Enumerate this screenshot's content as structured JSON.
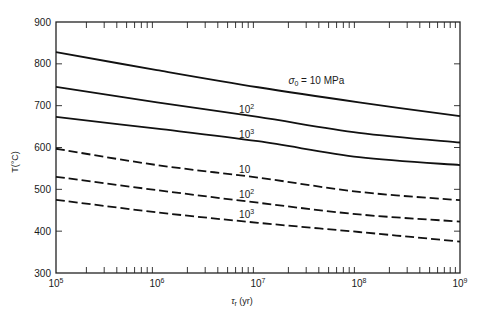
{
  "chart_data": {
    "type": "line",
    "title": "",
    "xlabel": "τr (yr)",
    "ylabel": "T(°C)",
    "xscale": "log",
    "xlim": [
      100000,
      1000000000
    ],
    "ylim": [
      300,
      900
    ],
    "x_ticks": [
      "10^5",
      "10^6",
      "10^7",
      "10^8",
      "10^9"
    ],
    "y_ticks": [
      "300",
      "400",
      "500",
      "600",
      "700",
      "800",
      "900"
    ],
    "grid": false,
    "x": [
      100000,
      1000000,
      10000000,
      100000000,
      1000000000
    ],
    "series": [
      {
        "name": "σ0 = 10 MPa (solid)",
        "label": "σ0 = 10 MPa",
        "style": "solid",
        "values": [
          828,
          785,
          744,
          708,
          675
        ]
      },
      {
        "name": "10^2 MPa (solid)",
        "label": "10²",
        "style": "solid",
        "values": [
          745,
          708,
          673,
          635,
          612
        ]
      },
      {
        "name": "10^3 MPa (solid)",
        "label": "10³",
        "style": "solid",
        "values": [
          673,
          645,
          615,
          577,
          558
        ]
      },
      {
        "name": "10 MPa (dashed)",
        "label": "10",
        "style": "dashed",
        "values": [
          597,
          558,
          528,
          494,
          474
        ]
      },
      {
        "name": "10^2 MPa (dashed)",
        "label": "10²",
        "style": "dashed",
        "values": [
          530,
          498,
          468,
          440,
          423
        ]
      },
      {
        "name": "10^3 MPa (dashed)",
        "label": "10³",
        "style": "dashed",
        "values": [
          475,
          445,
          420,
          398,
          375
        ]
      }
    ],
    "annotations": [
      {
        "text": "σ0 = 10 MPa",
        "x_at": 20000000,
        "y_at": 752
      },
      {
        "text": "10²",
        "x_at": 6500000,
        "y_at": 683
      },
      {
        "text": "10³",
        "x_at": 6500000,
        "y_at": 622
      },
      {
        "text": "10",
        "x_at": 6500000,
        "y_at": 540
      },
      {
        "text": "10²",
        "x_at": 6500000,
        "y_at": 480
      },
      {
        "text": "10³",
        "x_at": 6500000,
        "y_at": 431
      }
    ]
  },
  "labels": {
    "ylabel": "T(°C)",
    "xlabel_sym": "τ",
    "xlabel_sub": "r",
    "xlabel_unit": " (yr)",
    "sigma": "σ",
    "sigma_sub": "0",
    "sigma_rest": " = 10 MPa"
  }
}
